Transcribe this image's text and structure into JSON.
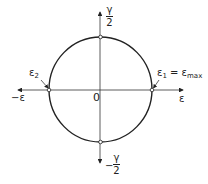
{
  "diagram": {
    "type": "mohr-circle-strain",
    "center_label": "0",
    "x_axis": {
      "positive_label": "ε",
      "negative_label": "−ε"
    },
    "y_axis": {
      "positive_label": {
        "numerator": "γ",
        "denominator": "2"
      },
      "negative_label": {
        "sign": "−",
        "numerator": "γ",
        "denominator": "2"
      }
    },
    "points": {
      "eps2": {
        "symbol": "ε",
        "subscript": "2"
      },
      "eps1": {
        "symbol": "ε",
        "subscript": "1",
        "equals": " = ε",
        "equals_subscript": "max"
      }
    },
    "colors": {
      "stroke": "#222222",
      "background": "#ffffff"
    }
  }
}
